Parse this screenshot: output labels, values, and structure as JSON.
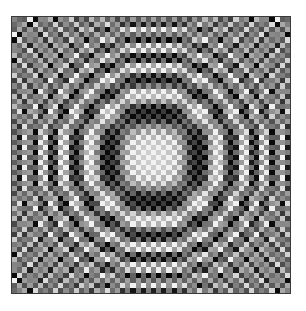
{
  "image": {
    "title": "Zone plate test pattern",
    "alt_text": "Grayscale pixelated concentric ring pattern",
    "canvas": {
      "width": 306,
      "height": 311
    },
    "background_color": "#ffffff"
  },
  "plate": {
    "name": "zone-plate",
    "left": 11,
    "top": 16,
    "width": 280,
    "height": 278,
    "border_color": "#3a3a3a",
    "border_width": 1
  },
  "caption": {
    "text": ""
  },
  "chart_data": {
    "type": "heatmap",
    "subtitle": "Separable chirp cos(a x^2) cos(a y^2) with checkerboard dither",
    "xlabel": "",
    "ylabel": "",
    "grid": false,
    "legend": "none",
    "colormap": "grayscale",
    "colormap_low": "#101010",
    "colormap_high": "#f2f2f2",
    "cmin": 0,
    "cmax": 255,
    "cols": 54,
    "rows": 54,
    "cell_size_px": 5.185,
    "center_col": 27,
    "center_row": 27,
    "center_px": {
      "x": 152,
      "y": 155
    },
    "x": [
      0,
      53
    ],
    "y": [
      0,
      53
    ],
    "xlim": [
      0,
      53
    ],
    "ylim": [
      0,
      53
    ],
    "generator": {
      "formula": "v = 0.5 + 0.5 * cos(a*(u^2)) * cos(a*(w^2)) ; u=(col-cc)/cc, w=(row-cr)/cr",
      "chirp_coefficient_a": 30.5,
      "dither_formula": "v = clamp(v + d*((col+row) mod 2 ? +1 : -1) * (0.28 + 0.34*radial))",
      "dither_amplitude": 0.3,
      "radial_dither_gain": 0.34,
      "gamma": 1.0,
      "value_min": 0.04,
      "value_max": 0.95
    },
    "ring_radii_cells_along_axis": [
      3,
      6,
      8,
      10,
      12,
      14,
      16,
      18,
      20,
      22,
      23,
      25,
      26
    ],
    "ring_count_visible": 9,
    "row_samples": {
      "description": "Normalized brightness (0=black,1=white) sampled along the horizontal centerline, left to right, one value per cell",
      "values": [
        0.52,
        0.3,
        0.72,
        0.24,
        0.78,
        0.2,
        0.8,
        0.22,
        0.74,
        0.32,
        0.62,
        0.4,
        0.52,
        0.48,
        0.44,
        0.58,
        0.34,
        0.7,
        0.26,
        0.8,
        0.22,
        0.84,
        0.2,
        0.82,
        0.26,
        0.7,
        0.38,
        0.18,
        0.38,
        0.7,
        0.26,
        0.82,
        0.2,
        0.84,
        0.22,
        0.8,
        0.26,
        0.7,
        0.34,
        0.58,
        0.44,
        0.48,
        0.52,
        0.4,
        0.62,
        0.32,
        0.74,
        0.22,
        0.8,
        0.2,
        0.78,
        0.24,
        0.72,
        0.3
      ]
    },
    "col_samples": {
      "description": "Normalized brightness sampled along the vertical centerline, top to bottom, one value per cell",
      "values": [
        0.5,
        0.32,
        0.7,
        0.26,
        0.76,
        0.22,
        0.78,
        0.24,
        0.72,
        0.34,
        0.6,
        0.42,
        0.5,
        0.5,
        0.42,
        0.6,
        0.32,
        0.72,
        0.24,
        0.8,
        0.2,
        0.84,
        0.2,
        0.82,
        0.26,
        0.7,
        0.38,
        0.18,
        0.38,
        0.7,
        0.26,
        0.82,
        0.2,
        0.84,
        0.2,
        0.8,
        0.24,
        0.72,
        0.32,
        0.6,
        0.42,
        0.5,
        0.5,
        0.42,
        0.6,
        0.34,
        0.72,
        0.24,
        0.78,
        0.22,
        0.76,
        0.26,
        0.7,
        0.32
      ]
    }
  }
}
